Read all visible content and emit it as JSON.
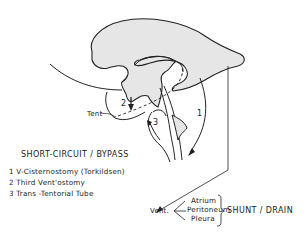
{
  "diagram": {
    "labels": {
      "tent": "Tent",
      "num1": "1",
      "num2": "2",
      "num3": "3",
      "vent": "Vent."
    },
    "bypass": {
      "title": "SHORT-CIRCUIT / BYPASS",
      "items": [
        "1  V-Cisternostomy (Torkildsen)",
        "2  Third Vent'ostomy",
        "3  Trans -Tentorial Tube"
      ]
    },
    "shunt": {
      "targets": [
        "Atrium",
        "Peritoneum",
        "Pleura"
      ],
      "title": "SHUNT / DRAIN"
    },
    "colors": {
      "fill": "#e6e6e6",
      "stroke": "#222222",
      "background": "#ffffff"
    }
  }
}
